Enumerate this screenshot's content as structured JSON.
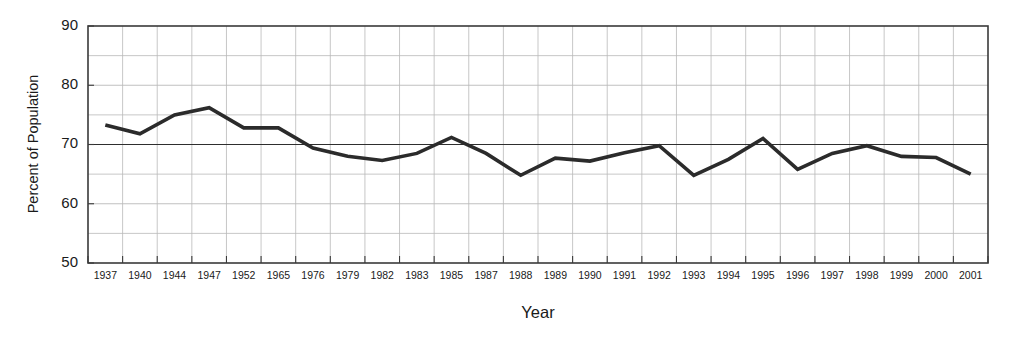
{
  "chart_data": {
    "type": "line",
    "title": "",
    "xlabel": "Year",
    "ylabel": "Percent of Population",
    "categories": [
      "1937",
      "1940",
      "1944",
      "1947",
      "1952",
      "1965",
      "1976",
      "1979",
      "1982",
      "1983",
      "1985",
      "1987",
      "1988",
      "1989",
      "1990",
      "1991",
      "1992",
      "1993",
      "1994",
      "1995",
      "1996",
      "1997",
      "1998",
      "1999",
      "2000",
      "2001"
    ],
    "values": [
      73.3,
      71.8,
      75.0,
      76.2,
      72.8,
      72.8,
      69.4,
      68.0,
      67.3,
      68.5,
      71.2,
      68.5,
      64.8,
      67.7,
      67.2,
      68.6,
      69.8,
      64.8,
      67.5,
      71.0,
      65.8,
      68.5,
      69.8,
      68.0,
      67.8,
      65.0
    ],
    "ylim": [
      50,
      90
    ],
    "ytick_labels": [
      "50",
      "60",
      "70",
      "80",
      "90"
    ],
    "ytick_values": [
      50,
      60,
      70,
      80,
      90
    ],
    "yminor_values": [
      55,
      65,
      75,
      85
    ],
    "grid": true,
    "legend": "none",
    "reference_line": 70,
    "series_color": "#2b2b2b",
    "grid_color": "#b9b9b9",
    "frame_color": "#3a3a3a"
  }
}
